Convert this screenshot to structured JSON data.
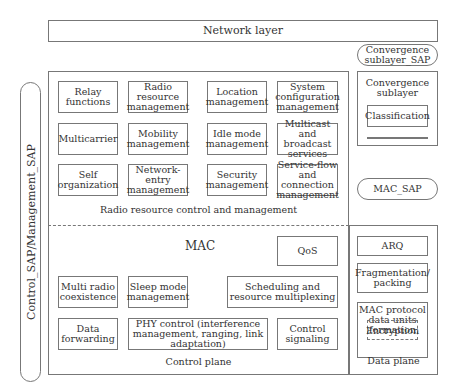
{
  "network_layer": "Network layer",
  "convergence_sap": "Convergence sublayer_SAP",
  "side_sap": "Control_SAP/Management_SAP",
  "rrcm": {
    "title": "Radio resource control and management",
    "items": [
      "Relay functions",
      "Radio resource management",
      "Location management",
      "System configuration management",
      "Multicarrier",
      "Mobility management",
      "Idle mode management",
      "Multicast and broadcast services",
      "Self organization",
      "Network-entry management",
      "Security management",
      "Service-flow and connection management"
    ]
  },
  "mac": {
    "title": "MAC",
    "qos": "QoS",
    "multi_radio": "Multi radio coexistence",
    "sleep_mode": "Sleep mode management",
    "scheduling": "Scheduling and resource multiplexing",
    "data_forwarding": "Data forwarding",
    "phy_control": "PHY control (interference management, ranging, link adaptation)",
    "control_signaling": "Control signaling",
    "plane": "Control plane"
  },
  "convergence": {
    "title": "Convergence sublayer",
    "classification": "Classification",
    "header": "Header suppression"
  },
  "mac_sap": "MAC_SAP",
  "data_plane": {
    "arq": "ARQ",
    "frag": "Fragmentation/ packing",
    "pdu": "MAC protocol data units formation",
    "encryption": "Encryption",
    "title": "Data plane"
  }
}
